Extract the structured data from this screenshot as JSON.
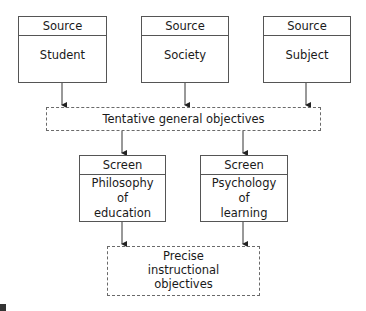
{
  "diagram": {
    "sources": [
      {
        "header": "Source",
        "label": "Student"
      },
      {
        "header": "Source",
        "label": "Society"
      },
      {
        "header": "Source",
        "label": "Subject"
      }
    ],
    "tentative": {
      "label": "Tentative general objectives"
    },
    "screens": [
      {
        "header": "Screen",
        "lines": [
          "Philosophy",
          "of",
          "education"
        ]
      },
      {
        "header": "Screen",
        "lines": [
          "Psychology",
          "of",
          "learning"
        ]
      }
    ],
    "precise": {
      "lines": [
        "Precise",
        "instructional",
        "objectives"
      ]
    },
    "colors": {
      "line": "#555555",
      "text": "#1a1a1a",
      "background": "#ffffff"
    }
  }
}
